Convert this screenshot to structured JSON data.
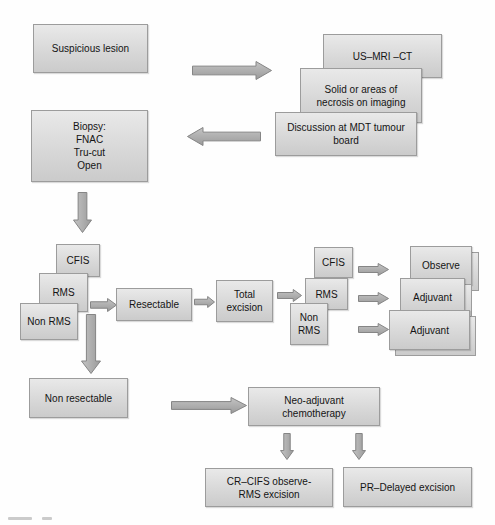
{
  "diagram": {
    "title_hint": "Suspicious lesion management flowchart",
    "suspicious_lesion": "Suspicious lesion",
    "imaging_stack": {
      "us_mri_ct": "US–MRI –CT",
      "solid_necrosis": "Solid or areas of\nnecrosis on imaging",
      "mdt_board": "Discussion at MDT tumour\nboard"
    },
    "biopsy": "Biopsy:\nFNAC\nTru-cut\nOpen",
    "histology_left": {
      "cfis": "CFIS",
      "rms": "RMS",
      "non_rms": "Non RMS"
    },
    "resectable": "Resectable",
    "total_excision": "Total\nexcision",
    "histology_right": {
      "cfis": "CFIS",
      "rms": "RMS",
      "non_rms": "Non\nRMS"
    },
    "outcomes": {
      "observe": "Observe",
      "adjuvant_rms": "Adjuvant",
      "adjuvant_non_rms": "Adjuvant"
    },
    "non_resectable": "Non resectable",
    "neo_adjuvant": "Neo-adjuvant\nchemotherapy",
    "cr_cifs": "CR–CIFS observe-\nRMS excision",
    "pr_delayed": "PR–Delayed excision"
  },
  "colors": {
    "background": "#fefefe",
    "box_fill_top": "#e9e9e9",
    "box_fill_bottom": "#cbcbcb",
    "box_border": "#9c9c9c",
    "arrow_light": "#c4c4c4",
    "arrow_dark": "#9a9a9a",
    "arrow_border": "#858585"
  }
}
